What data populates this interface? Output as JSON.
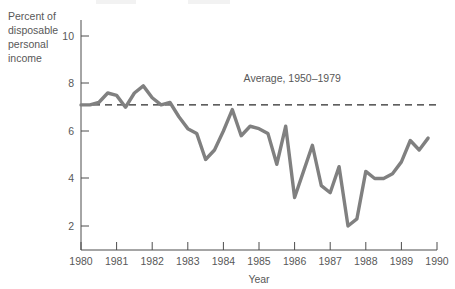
{
  "chart_data": {
    "type": "line",
    "title": "",
    "subtitle": "",
    "xlabel": "Year",
    "ylabel": "Percent of disposable personal income",
    "ylabel_lines": [
      "Percent of",
      "disposable",
      "personal",
      "income"
    ],
    "xlim": [
      1980,
      1990
    ],
    "ylim": [
      0,
      11
    ],
    "yticks": [
      2,
      4,
      6,
      8,
      10
    ],
    "ytick_labels": [
      "2",
      "4",
      "6",
      "8",
      "10"
    ],
    "xticks": [
      1980,
      1981,
      1982,
      1983,
      1984,
      1985,
      1986,
      1987,
      1988,
      1989,
      1990
    ],
    "xtick_labels": [
      "1980",
      "1981",
      "1982",
      "1983",
      "1984",
      "1985",
      "1986",
      "1987",
      "1988",
      "1989",
      "1990"
    ],
    "grid": false,
    "legend": false,
    "legend_position": "none",
    "line_color": "#808080",
    "annotations": [
      {
        "name": "average-label",
        "text": "Average, 1950–1979",
        "x": 1987.3,
        "y": 8.05
      }
    ],
    "reference_lines": [
      {
        "name": "average-1950-1979",
        "label": "Average, 1950–1979",
        "value": 7.1,
        "style": "dashed",
        "color": "#2b2b2b",
        "orientation": "horizontal"
      }
    ],
    "series": [
      {
        "name": "Personal saving rate",
        "color": "#808080",
        "x": [
          1980.0,
          1980.25,
          1980.5,
          1980.75,
          1981.0,
          1981.25,
          1981.5,
          1981.75,
          1982.0,
          1982.25,
          1982.5,
          1982.75,
          1983.0,
          1983.25,
          1983.5,
          1983.75,
          1984.0,
          1984.25,
          1984.5,
          1984.75,
          1985.0,
          1985.25,
          1985.5,
          1985.75,
          1986.0,
          1986.25,
          1986.5,
          1986.75,
          1987.0,
          1987.25,
          1987.5,
          1987.75,
          1988.0,
          1988.25,
          1988.5,
          1988.75,
          1989.0,
          1989.25,
          1989.5,
          1989.75
        ],
        "values": [
          7.1,
          7.1,
          7.2,
          7.6,
          7.5,
          7.0,
          7.6,
          7.9,
          7.4,
          7.1,
          7.2,
          6.6,
          6.1,
          5.9,
          4.8,
          5.2,
          6.0,
          6.9,
          5.8,
          6.2,
          6.1,
          5.9,
          4.6,
          6.2,
          3.2,
          4.3,
          5.4,
          3.7,
          3.4,
          4.5,
          2.0,
          2.3,
          4.3,
          4.0,
          4.0,
          4.2,
          4.7,
          5.6,
          5.2,
          5.7
        ]
      }
    ]
  },
  "axes": {
    "y_tick_label_values": [
      "2",
      "4",
      "6",
      "8",
      "10"
    ],
    "x_tick_label_values": [
      "1980",
      "1981",
      "1982",
      "1983",
      "1984",
      "1985",
      "1986",
      "1987",
      "1988",
      "1989",
      "1990"
    ],
    "x_axis_title": "Year",
    "y_axis_title_lines": [
      "Percent of",
      "disposable",
      "personal",
      "income"
    ]
  },
  "annotation": {
    "average_label": "Average, 1950–1979"
  },
  "colors": {
    "line": "#808080",
    "axis": "#4d4d4d",
    "reference": "#2b2b2b",
    "text": "#585858",
    "background": "#ffffff"
  }
}
